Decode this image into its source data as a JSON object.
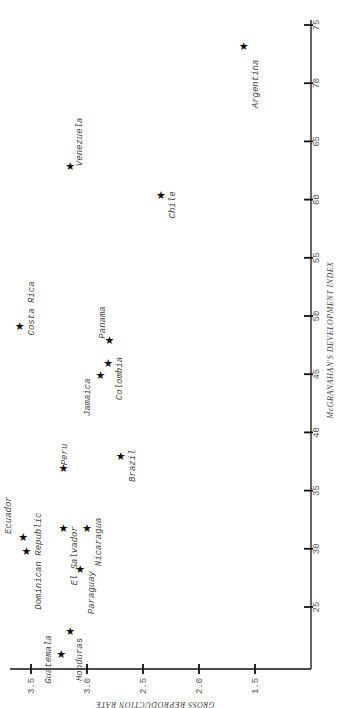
{
  "chart_data": {
    "type": "scatter",
    "title": "",
    "orientation": "rotated 90 degrees (page landscape)",
    "xlabel": "GROSS REPRODUCTION RATE",
    "ylabel": "McGRANAHAN'S DEVELOPMENT INDEX",
    "xlim": [
      1.2,
      3.65
    ],
    "ylim": [
      20,
      75
    ],
    "x_ticks": [
      "3.5",
      "3.0",
      "2.5",
      "2.0",
      "1.5"
    ],
    "y_ticks": [
      "25",
      "30",
      "35",
      "40",
      "45",
      "50",
      "55",
      "60",
      "65",
      "70",
      "75"
    ],
    "grid": false,
    "marker": "star",
    "points": [
      {
        "label": "Argentina",
        "gross_reproduction_rate": 1.6,
        "development_index": 73.2
      },
      {
        "label": "Venezuela",
        "gross_reproduction_rate": 3.15,
        "development_index": 62.9
      },
      {
        "label": "Chile",
        "gross_reproduction_rate": 2.34,
        "development_index": 60.4
      },
      {
        "label": "Costa Rica",
        "gross_reproduction_rate": 3.6,
        "development_index": 49.1
      },
      {
        "label": "Panama",
        "gross_reproduction_rate": 2.8,
        "development_index": 47.9
      },
      {
        "label": "Colombia",
        "gross_reproduction_rate": 2.81,
        "development_index": 46.0
      },
      {
        "label": "Jamaica",
        "gross_reproduction_rate": 2.88,
        "development_index": 44.9
      },
      {
        "label": "Brazil",
        "gross_reproduction_rate": 2.7,
        "development_index": 38.0
      },
      {
        "label": "Peru",
        "gross_reproduction_rate": 3.21,
        "development_index": 36.9
      },
      {
        "label": "Ecuador",
        "gross_reproduction_rate": 3.57,
        "development_index": 31.0
      },
      {
        "label": "Dominican Republic",
        "gross_reproduction_rate": 3.54,
        "development_index": 29.8
      },
      {
        "label": "El Salvador",
        "gross_reproduction_rate": 3.21,
        "development_index": 31.8
      },
      {
        "label": "Nicaragua",
        "gross_reproduction_rate": 3.0,
        "development_index": 31.8
      },
      {
        "label": "Paraguay",
        "gross_reproduction_rate": 3.06,
        "development_index": 28.3
      },
      {
        "label": "Honduras",
        "gross_reproduction_rate": 3.15,
        "development_index": 22.9
      },
      {
        "label": "Guatemala",
        "gross_reproduction_rate": 3.23,
        "development_index": 21.0
      }
    ]
  }
}
